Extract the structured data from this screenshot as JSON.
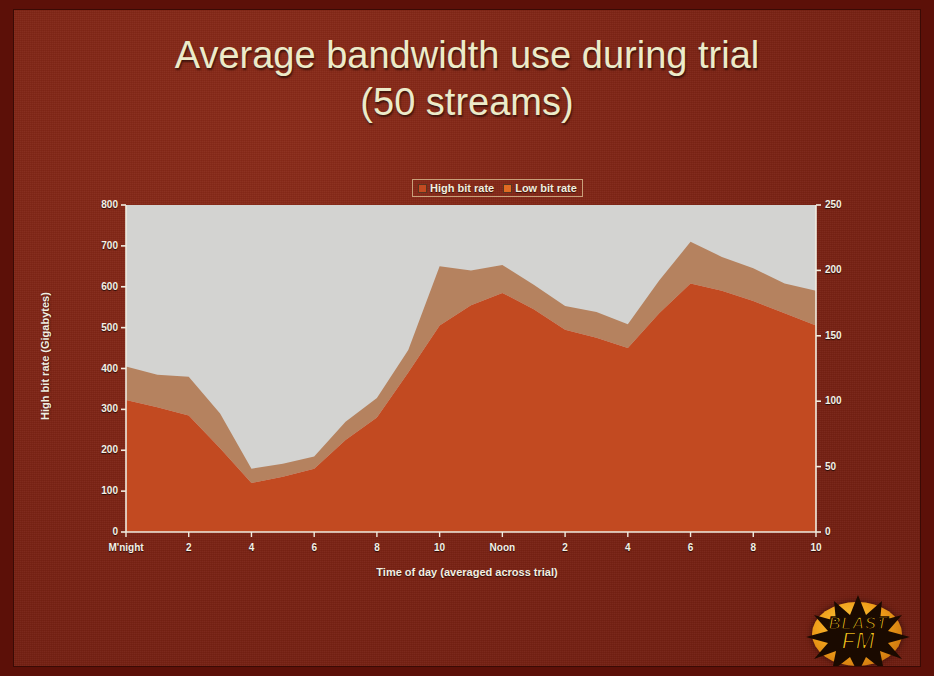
{
  "slide": {
    "background_color": "#7d2314",
    "title_line1": "Average bandwidth use during trial",
    "title_line2": "(50 streams)",
    "title_color": "#ecebc9"
  },
  "logo": {
    "name": "BLAST FM",
    "word_top": "BLAST",
    "word_bottom": "FM",
    "star_color": "#1a0a00",
    "disc_color": "#f0a01a",
    "text_color": "#f6c21b"
  },
  "chart_data": {
    "type": "area",
    "stacked": true,
    "title": "Average bandwidth use during trial (50 streams)",
    "xlabel": "Time of day (averaged across trial)",
    "ylabel": "High bit rate (Gigabytes)",
    "ylabel_secondary": "Low bit rate (Gigabytes)",
    "ylim": [
      0,
      800
    ],
    "yticks": [
      0,
      100,
      200,
      300,
      400,
      500,
      600,
      700,
      800
    ],
    "ylim_secondary": [
      0,
      250
    ],
    "yticks_secondary": [
      0,
      50,
      100,
      150,
      200,
      250
    ],
    "grid": false,
    "legend_position": "top",
    "plot_background": "#d3d3d1",
    "categories": [
      "M'night",
      "1",
      "2",
      "3",
      "4",
      "5",
      "6",
      "7",
      "8",
      "9",
      "10",
      "11",
      "Noon",
      "1",
      "2",
      "3",
      "4",
      "5",
      "6",
      "7",
      "8",
      "9",
      "10"
    ],
    "xtick_labels": [
      "M'night",
      "2",
      "4",
      "6",
      "8",
      "10",
      "Noon",
      "2",
      "4",
      "6",
      "8",
      "10"
    ],
    "xtick_indices": [
      0,
      2,
      4,
      6,
      8,
      10,
      12,
      14,
      16,
      18,
      20,
      22
    ],
    "series": [
      {
        "name": "High bit rate",
        "color": "#c24a21",
        "axis": "left",
        "units": "Gigabytes",
        "values": [
          323,
          305,
          285,
          205,
          120,
          135,
          155,
          225,
          280,
          390,
          505,
          555,
          585,
          545,
          495,
          475,
          450,
          535,
          608,
          590,
          565,
          535,
          505
        ]
      },
      {
        "name": "Low bit rate",
        "color": "#b5825f",
        "axis": "right",
        "units": "Gigabytes",
        "values": [
          25,
          26,
          30,
          23,
          11,
          10,
          9,
          14,
          15,
          17,
          45,
          27,
          21,
          19,
          18,
          20,
          18,
          25,
          32,
          26,
          25,
          23,
          27
        ],
        "stacked_tops_left_axis": [
          405,
          385,
          380,
          290,
          155,
          167,
          185,
          270,
          328,
          445,
          650,
          640,
          653,
          605,
          553,
          538,
          508,
          615,
          710,
          673,
          645,
          608,
          590
        ]
      }
    ]
  },
  "legend": {
    "items": [
      {
        "label": "High bit rate",
        "color": "#c24a21"
      },
      {
        "label": "Low bit rate",
        "color": "#e06a22"
      }
    ]
  }
}
